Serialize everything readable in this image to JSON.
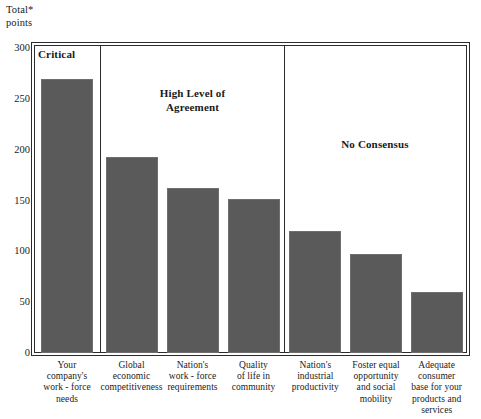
{
  "chart_data": {
    "type": "bar",
    "title": "",
    "xlabel": "",
    "ylabel": "Total*\npoints",
    "ylim": [
      0,
      300
    ],
    "yticks": [
      0,
      50,
      100,
      150,
      200,
      250,
      300
    ],
    "ytick_labels": [
      "0",
      "50",
      "100",
      "150",
      "200",
      "250",
      "300"
    ],
    "grid": false,
    "legend": null,
    "bar_color": "#5a5a5a",
    "categories": [
      "Your\ncompany's\nwork - force\nneeds",
      "Global\neconomic\ncompetitiveness",
      "Nation's\nwork - force\nrequirements",
      "Quality\nof life in\ncommunity",
      "Nation's\nindustrial\nproductivity",
      "Foster equal\nopportunity\nand social\nmobility",
      "Adequate\nconsumer\nbase for your\nproducts and\nservices"
    ],
    "values": [
      270,
      193,
      162,
      151,
      120,
      97,
      60
    ],
    "annotations": [
      {
        "text": "Critical",
        "group": 1
      },
      {
        "text": "High Level of\nAgreement",
        "group": 2
      },
      {
        "text": "No Consensus",
        "group": 3
      }
    ],
    "groups": [
      {
        "label": "Critical",
        "categories": [
          0
        ]
      },
      {
        "label": "High Level of Agreement",
        "categories": [
          1,
          2,
          3
        ]
      },
      {
        "label": "No Consensus",
        "categories": [
          4,
          5,
          6
        ]
      }
    ]
  },
  "axis": {
    "title_line1": "Total*",
    "title_line2": "points"
  }
}
